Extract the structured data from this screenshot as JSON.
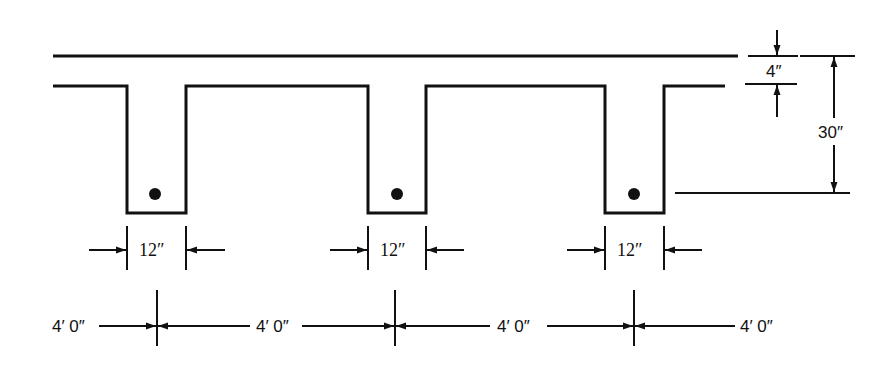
{
  "diagram": {
    "title": "",
    "type": "T-beam floor system cross-section",
    "colors": {
      "ink": "#111111",
      "background": "#ffffff"
    },
    "dimensions": {
      "slab_thickness": "4″",
      "total_depth": "30″",
      "stem_widths": [
        "12″",
        "12″",
        "12″"
      ],
      "spacings": [
        "4′ 0″",
        "4′ 0″",
        "4′ 0″",
        "4′ 0″"
      ]
    },
    "elements": {
      "stems": 3,
      "rebar_dots": 3
    }
  }
}
